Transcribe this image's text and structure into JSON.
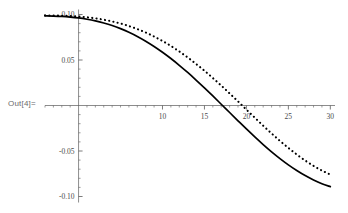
{
  "output_label": "Out[4]=",
  "chart_data": {
    "type": "line",
    "title": "",
    "xlabel": "",
    "ylabel": "",
    "xlim": [
      -4,
      30.2
    ],
    "ylim": [
      -0.108,
      0.108
    ],
    "grid": false,
    "legend": "none",
    "axis_style": "mathematica-crossing-axes",
    "x_ticks_major": [
      10,
      15,
      20,
      25,
      30
    ],
    "x_tick_labels": [
      "10",
      "15",
      "20",
      "25",
      "30"
    ],
    "x_ticks_minor_step": 1,
    "y_ticks_major": [
      0.1,
      0.05,
      -0.05,
      -0.1
    ],
    "y_tick_labels": [
      "0.10",
      "0.05",
      "-0.05",
      "-0.10"
    ],
    "y_ticks_minor_step": 0.01,
    "axis_color": "#5a5a5a",
    "curve_color": "#000000",
    "series": [
      {
        "name": "solid-curve",
        "style": "solid",
        "x": [
          -4.0,
          -3.0,
          -2.0,
          -1.0,
          0.0,
          1.0,
          2.0,
          3.0,
          4.0,
          5.0,
          6.0,
          7.0,
          8.0,
          9.0,
          10.0,
          11.0,
          12.0,
          13.0,
          14.0,
          15.0,
          16.0,
          17.0,
          18.0,
          19.0,
          20.0,
          21.0,
          22.0,
          23.0,
          24.0,
          25.0,
          26.0,
          27.0,
          28.0,
          29.0,
          30.0
        ],
        "y": [
          0.0985,
          0.0983,
          0.0979,
          0.0972,
          0.0962,
          0.0948,
          0.093,
          0.0907,
          0.0879,
          0.0845,
          0.0805,
          0.0759,
          0.0707,
          0.0649,
          0.0585,
          0.0516,
          0.0442,
          0.0363,
          0.028,
          0.0194,
          0.0105,
          0.0014,
          -0.0077,
          -0.0168,
          -0.0258,
          -0.0345,
          -0.0429,
          -0.0509,
          -0.0583,
          -0.0652,
          -0.0714,
          -0.077,
          -0.0818,
          -0.0859,
          -0.0892
        ]
      },
      {
        "name": "dotted-curve",
        "style": "dotted",
        "x": [
          -4.0,
          -3.0,
          -2.0,
          -1.0,
          0.0,
          1.0,
          2.0,
          3.0,
          4.0,
          5.0,
          6.0,
          7.0,
          8.0,
          9.0,
          10.0,
          11.0,
          12.0,
          13.0,
          14.0,
          15.0,
          16.0,
          17.0,
          18.0,
          19.0,
          20.0,
          21.0,
          22.0,
          23.0,
          24.0,
          25.0,
          26.0,
          27.0,
          28.0,
          29.0,
          30.0
        ],
        "y": [
          0.099,
          0.0989,
          0.0987,
          0.0983,
          0.0977,
          0.0969,
          0.0958,
          0.0943,
          0.0924,
          0.0901,
          0.0873,
          0.084,
          0.0802,
          0.0758,
          0.0709,
          0.0654,
          0.0594,
          0.0528,
          0.0457,
          0.0382,
          0.0302,
          0.0219,
          0.0133,
          0.0045,
          -0.0045,
          -0.0134,
          -0.0222,
          -0.0307,
          -0.0389,
          -0.0466,
          -0.0538,
          -0.0604,
          -0.0663,
          -0.0715,
          -0.0759
        ]
      }
    ]
  }
}
